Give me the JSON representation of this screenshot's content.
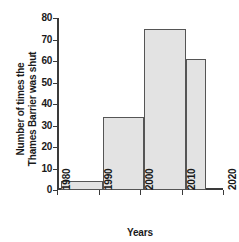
{
  "chart_data": {
    "type": "bar",
    "title": "",
    "subtitle": "",
    "xlabel": "Years",
    "ylabel": "Number of times the Thames Barrier was shut",
    "ylabel_lines": [
      "Number of times the",
      "Thames Barrier was shut"
    ],
    "xlim": [
      1980,
      2020
    ],
    "ylim": [
      0,
      80
    ],
    "grid": false,
    "legend": false,
    "bar_style": {
      "fill": "#e3e3e3",
      "edge": "#555555"
    },
    "axis_color": "#3a3a3a",
    "background": "#ffffff",
    "x_ticks": [
      1980,
      1990,
      2000,
      2010,
      2020
    ],
    "x_tick_labels": [
      "1980",
      "1990",
      "2000",
      "2010",
      "2020"
    ],
    "y_ticks": [
      0,
      10,
      20,
      30,
      40,
      50,
      60,
      70,
      80
    ],
    "y_tick_labels": [
      "0",
      "10",
      "20",
      "30",
      "40",
      "50",
      "60",
      "70",
      "80"
    ],
    "bins": [
      {
        "label": "1980-1990",
        "x_start": 1981,
        "x_end": 1991,
        "value": 4
      },
      {
        "label": "1990-2000",
        "x_start": 1991,
        "x_end": 2001,
        "value": 34
      },
      {
        "label": "2000-2010",
        "x_start": 2001,
        "x_end": 2011,
        "value": 75
      },
      {
        "label": "2010-2015",
        "x_start": 2011,
        "x_end": 2016,
        "value": 61
      }
    ],
    "categories": [
      "1980-1990",
      "1990-2000",
      "2000-2010",
      "2010-2015"
    ],
    "values": [
      4,
      34,
      75,
      61
    ]
  }
}
